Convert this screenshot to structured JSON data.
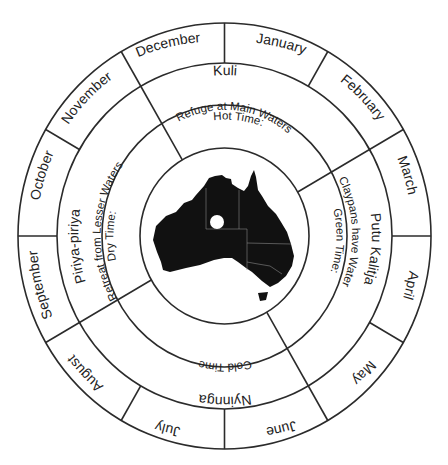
{
  "diagram": {
    "type": "seasonal-calendar-wheel",
    "center_map": {
      "label": "australia-map",
      "marker": "white-dot"
    },
    "months": [
      "January",
      "February",
      "March",
      "April",
      "May",
      "June",
      "July",
      "August",
      "September",
      "October",
      "November",
      "December"
    ],
    "seasons": [
      {
        "name": "Kuli",
        "description_line1": "Hot Time:",
        "description_line2": "Refuge at Main Waters",
        "months": [
          "December",
          "January",
          "February"
        ]
      },
      {
        "name": "Putu Kalitja",
        "description_line1": "Green Time:",
        "description_line2": "Claypans have Water",
        "months": [
          "March",
          "April",
          "May"
        ]
      },
      {
        "name": "Nyinnga",
        "description_line1": "Cold Time",
        "description_line2": "",
        "months": [
          "June",
          "July",
          "August"
        ]
      },
      {
        "name": "Piriya-piriya",
        "description_line1": "Dry Time:",
        "description_line2": "Retreat from Lesser Waters",
        "months": [
          "September",
          "October",
          "November"
        ]
      }
    ],
    "colors": {
      "line": "#2b2b2b",
      "map": "#111111",
      "background": "#ffffff"
    }
  }
}
